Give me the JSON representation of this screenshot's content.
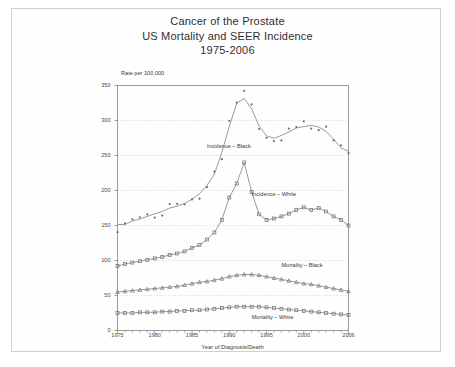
{
  "page": {
    "title_lines": [
      "Cancer of the Prostate",
      "US Mortality and SEER Incidence",
      "1975-2006"
    ]
  },
  "chart_data": {
    "type": "line",
    "title": "Cancer of the Prostate US Mortality and SEER Incidence 1975-2006",
    "xlabel": "Year of Diagnosis/Death",
    "ylabel": "Rate per 100,000",
    "xlim": [
      1975,
      2006
    ],
    "ylim": [
      0,
      350
    ],
    "ytick_values": [
      0,
      50,
      100,
      150,
      200,
      250,
      300,
      350
    ],
    "ytick_labels": [
      "0",
      "50",
      "100",
      "150",
      "200",
      "250",
      "300",
      "350"
    ],
    "xtick_values": [
      1975,
      1980,
      1985,
      1990,
      1995,
      2000,
      2006
    ],
    "xtick_labels": [
      "1975",
      "1980",
      "1985",
      "1990",
      "1995",
      "2000",
      "2006"
    ],
    "grid": "horizontal-dotted",
    "legend_position": "inline-annotations",
    "x": [
      1975,
      1976,
      1977,
      1978,
      1979,
      1980,
      1981,
      1982,
      1983,
      1984,
      1985,
      1986,
      1987,
      1988,
      1989,
      1990,
      1991,
      1992,
      1993,
      1994,
      1995,
      1996,
      1997,
      1998,
      1999,
      2000,
      2001,
      2002,
      2003,
      2004,
      2005,
      2006
    ],
    "series": [
      {
        "name": "Incidence - Black",
        "label": "Incidence – Black",
        "marker": "dot",
        "values": [
          145,
          158,
          151,
          161,
          165,
          163,
          172,
          175,
          178,
          180,
          186,
          197,
          203,
          222,
          245,
          296,
          333,
          345,
          317,
          288,
          271,
          275,
          278,
          283,
          290,
          295,
          289,
          295,
          288,
          270,
          262,
          250
        ]
      },
      {
        "name": "Incidence - White",
        "label": "Incidence – White",
        "marker": "square",
        "values": [
          92,
          95,
          97,
          99,
          101,
          103,
          105,
          108,
          110,
          113,
          118,
          122,
          130,
          140,
          158,
          190,
          210,
          240,
          198,
          166,
          158,
          160,
          163,
          167,
          172,
          176,
          172,
          175,
          170,
          163,
          158,
          150
        ]
      },
      {
        "name": "Mortality - Black",
        "label": "Mortality – Black",
        "marker": "triangle",
        "values": [
          55,
          56,
          57,
          58,
          59,
          60,
          61,
          62,
          63,
          65,
          67,
          69,
          70,
          72,
          74,
          77,
          79,
          80,
          80,
          79,
          77,
          75,
          73,
          71,
          69,
          67,
          66,
          64,
          62,
          60,
          58,
          56
        ]
      },
      {
        "name": "Mortality - White",
        "label": "Mortality – White",
        "marker": "square",
        "values": [
          25,
          25,
          25,
          26,
          26,
          26,
          27,
          27,
          28,
          28,
          29,
          29,
          30,
          31,
          32,
          33,
          34,
          34,
          34,
          34,
          33,
          32,
          31,
          30,
          29,
          28,
          27,
          26,
          25,
          24,
          23,
          22
        ]
      }
    ],
    "annotations": [
      {
        "text": "Incidence – Black",
        "x": 1987,
        "y": 262
      },
      {
        "text": "Incidence – White",
        "x": 1993,
        "y": 193
      },
      {
        "text": "Mortality – Black",
        "x": 1997,
        "y": 92
      },
      {
        "text": "Mortality – White",
        "x": 1993,
        "y": 18
      }
    ],
    "colors": {
      "line": "#808080",
      "marker": "#6f6f6f",
      "grid": "#b8b8b8",
      "axis": "#909090",
      "text": "#3a3a3a"
    }
  }
}
